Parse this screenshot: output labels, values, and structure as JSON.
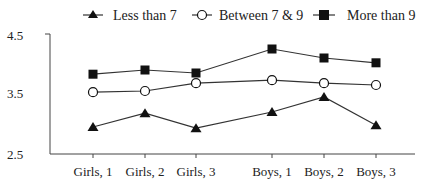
{
  "chart_data": {
    "type": "line",
    "title": "",
    "xlabel": "",
    "ylabel": "",
    "categories": [
      "Girls, 1",
      "Girls, 2",
      "Girls, 3",
      "Boys, 1",
      "Boys, 2",
      "Boys, 3"
    ],
    "ylim": [
      2.5,
      4.5
    ],
    "yticks": [
      "4.5",
      "3.5",
      "2.5"
    ],
    "grid": false,
    "legend_position": "top",
    "series": [
      {
        "name": "Less than 7",
        "marker": "triangle-filled",
        "values": [
          2.95,
          3.18,
          2.93,
          3.2,
          3.45,
          2.98
        ]
      },
      {
        "name": "Between 7 & 9",
        "marker": "circle-open",
        "values": [
          3.53,
          3.55,
          3.68,
          3.73,
          3.68,
          3.65
        ]
      },
      {
        "name": "More than 9",
        "marker": "square-filled",
        "values": [
          3.83,
          3.9,
          3.85,
          4.25,
          4.1,
          4.02
        ]
      }
    ]
  },
  "legend": {
    "items": [
      "Less than 7",
      "Between 7 & 9",
      "More than 9"
    ]
  },
  "axis": {
    "y_top": "4.5",
    "y_mid": "3.5",
    "y_bottom": "2.5",
    "x_labels": [
      "Girls, 1",
      "Girls, 2",
      "Girls, 3",
      "Boys, 1",
      "Boys, 2",
      "Boys, 3"
    ]
  },
  "colors": {
    "line": "#333333",
    "marker": "#111111",
    "axis": "#444444"
  }
}
